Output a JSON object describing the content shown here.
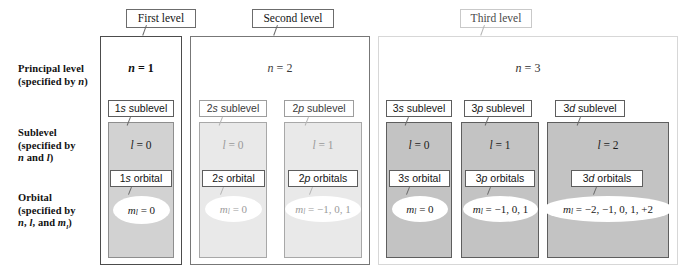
{
  "figure": {
    "row_labels": [
      {
        "line1": "Principal level",
        "line2": "(specified by n)"
      },
      {
        "line1": "Sublevel",
        "line2": "(specified by",
        "line3": "n and l)"
      },
      {
        "line1": "Orbital",
        "line2": "(specified by",
        "line3": "n, l, and ml)"
      }
    ],
    "levels": [
      {
        "tag": "First level",
        "n_label": "n = 1",
        "sublevels": [
          {
            "name": "1s sublevel",
            "l_label": "l = 0",
            "orbital_label": "1s orbital",
            "ml_label": "ml = 0"
          }
        ]
      },
      {
        "tag": "Second level",
        "n_label": "n = 2",
        "sublevels": [
          {
            "name": "2s sublevel",
            "l_label": "l = 0",
            "orbital_label": "2s orbital",
            "ml_label": "ml = 0"
          },
          {
            "name": "2p sublevel",
            "l_label": "l = 1",
            "orbital_label": "2p orbitals",
            "ml_label": "ml = −1, 0, 1"
          }
        ]
      },
      {
        "tag": "Third level",
        "n_label": "n = 3",
        "sublevels": [
          {
            "name": "3s sublevel",
            "l_label": "l = 0",
            "orbital_label": "3s orbital",
            "ml_label": "ml = 0"
          },
          {
            "name": "3p sublevel",
            "l_label": "l = 1",
            "orbital_label": "3p orbitals",
            "ml_label": "ml = −1, 0, 1"
          },
          {
            "name": "3d sublevel",
            "l_label": "l = 2",
            "orbital_label": "3d orbitals",
            "ml_label": "ml = −2, −1, 0, 1, +2"
          }
        ]
      }
    ],
    "colors": {
      "background": "#ffffff",
      "level1_sublevel_fill": "#d2d2d2",
      "level2_sublevel_fill": "#e9e9e9",
      "level3_sublevel_fill": "#c3c3c3",
      "box_border": "#5d5d5d",
      "faded_border": "#d7d7d7",
      "text": "#1a1a1a"
    }
  }
}
